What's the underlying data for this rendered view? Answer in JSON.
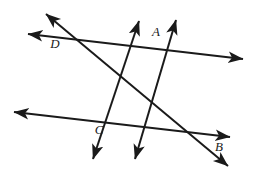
{
  "figure": {
    "background_color": "#ffffff",
    "stroke_color": "#1a1a1a",
    "stroke_width": 2.0,
    "width": 256,
    "height": 173
  },
  "labels": {
    "a": "A",
    "b": "B",
    "c": "C",
    "d": "D"
  },
  "label_positions": {
    "a": {
      "x": 156,
      "y": 33
    },
    "b": {
      "x": 219,
      "y": 148
    },
    "c": {
      "x": 99,
      "y": 131
    },
    "d": {
      "x": 55,
      "y": 45
    }
  },
  "points": {
    "a": {
      "x": 156,
      "y": 50,
      "name": "A",
      "description": "intersection of upper parallel line and right transversal"
    },
    "b": {
      "x": 215,
      "y": 138,
      "name": "B",
      "description": "intersection of lower parallel line and left transversal extended"
    },
    "c": {
      "x": 113,
      "y": 122,
      "name": "C",
      "description": "intersection of lower parallel line and both transversals"
    },
    "d": {
      "x": 57,
      "y": 38,
      "name": "D",
      "description": "intersection of upper parallel line and left transversal"
    }
  },
  "lines": [
    {
      "id": "upper-parallel-line",
      "name": "upper-parallel-line",
      "from": {
        "x": 28,
        "y": 34
      },
      "to": {
        "x": 243,
        "y": 59
      },
      "arrow_start": true,
      "arrow_end": true,
      "passes_through": [
        "D",
        "A"
      ]
    },
    {
      "id": "lower-parallel-line",
      "name": "lower-parallel-line",
      "from": {
        "x": 14,
        "y": 112
      },
      "to": {
        "x": 230,
        "y": 137
      },
      "arrow_start": true,
      "arrow_end": true,
      "passes_through": [
        "C",
        "B"
      ]
    },
    {
      "id": "transversal-d-to-b",
      "name": "transversal-d-to-b",
      "from": {
        "x": 46,
        "y": 14
      },
      "to": {
        "x": 228,
        "y": 166
      },
      "arrow_start": true,
      "arrow_end": true,
      "passes_through": [
        "D",
        "C",
        "B"
      ]
    },
    {
      "id": "transversal-a-left-branch",
      "name": "transversal-a-left-branch",
      "from": {
        "x": 139,
        "y": 21
      },
      "to": {
        "x": 93,
        "y": 159
      },
      "arrow_start": true,
      "arrow_end": true,
      "passes_through": [
        "A",
        "C"
      ]
    },
    {
      "id": "transversal-a-right-branch",
      "name": "transversal-a-right-branch",
      "from": {
        "x": 176,
        "y": 20
      },
      "to": {
        "x": 135,
        "y": 159
      },
      "arrow_start": true,
      "arrow_end": true,
      "passes_through": [
        "A",
        "C"
      ]
    }
  ],
  "chart_data": {
    "type": "diagram",
    "shape": "two parallel lines crossed by two intersecting transversal lines",
    "vertices": [
      {
        "label": "A",
        "x": 156,
        "y": 50
      },
      {
        "label": "B",
        "x": 215,
        "y": 138
      },
      {
        "label": "C",
        "x": 113,
        "y": 122
      },
      {
        "label": "D",
        "x": 57,
        "y": 38
      }
    ],
    "segments": [
      {
        "name": "upper-parallel-line",
        "endpoints": [
          [
            28,
            34
          ],
          [
            243,
            59
          ]
        ]
      },
      {
        "name": "lower-parallel-line",
        "endpoints": [
          [
            14,
            112
          ],
          [
            230,
            137
          ]
        ]
      },
      {
        "name": "transversal-d-to-b",
        "endpoints": [
          [
            46,
            14
          ],
          [
            228,
            166
          ]
        ]
      },
      {
        "name": "transversal-a-to-c-left",
        "endpoints": [
          [
            139,
            21
          ],
          [
            93,
            159
          ]
        ]
      },
      {
        "name": "transversal-a-to-c-right",
        "endpoints": [
          [
            176,
            20
          ],
          [
            135,
            159
          ]
        ]
      }
    ]
  }
}
